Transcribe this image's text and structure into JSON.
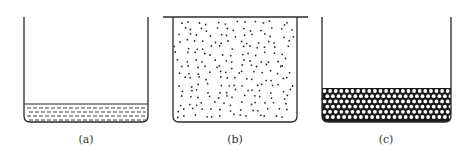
{
  "figure": {
    "panels": [
      {
        "id": "a",
        "caption": "(a)",
        "state": "liquid",
        "description": "Open beaker with thin liquid layer at bottom (dashed hatching)",
        "beaker": {
          "left": 24,
          "right": 148,
          "top": 17,
          "bottom": 122
        },
        "fill_top": 104,
        "lid": false
      },
      {
        "id": "b",
        "caption": "(b)",
        "state": "gas",
        "description": "Covered beaker filled with scattered particles (dots)",
        "beaker": {
          "left": 173,
          "right": 297,
          "top": 17,
          "bottom": 122
        },
        "lid": true,
        "lid_extent": [
          163,
          308
        ]
      },
      {
        "id": "c",
        "caption": "(c)",
        "state": "solid",
        "description": "Open beaker with closely packed particles at bottom",
        "beaker": {
          "left": 322,
          "right": 451,
          "top": 17,
          "bottom": 122
        },
        "fill_top": 88,
        "lid": false
      }
    ],
    "colors": {
      "line": "#2a2a2a",
      "fill_dark": "#1a1a1a",
      "background": "#ffffff"
    }
  }
}
